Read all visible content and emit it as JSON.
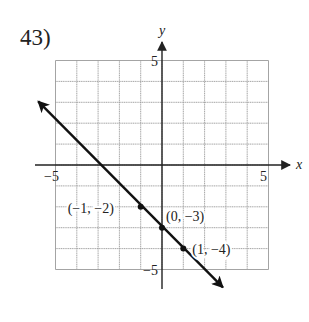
{
  "problem_number": "43)",
  "chart_data": {
    "type": "line",
    "title": "",
    "xlabel": "x",
    "ylabel": "y",
    "xlim": [
      -5,
      5
    ],
    "ylim": [
      -5,
      5
    ],
    "grid": true,
    "grid_step": 1,
    "x_tick_labels": [
      {
        "value": -5,
        "label": "−5"
      },
      {
        "value": 5,
        "label": "5"
      }
    ],
    "y_tick_labels": [
      {
        "value": 5,
        "label": "5"
      },
      {
        "value": -5,
        "label": "−5"
      }
    ],
    "line": {
      "equation": "y = -x - 3",
      "slope": -1,
      "intercept": -3,
      "arrow_start": [
        -6,
        3
      ],
      "arrow_end": [
        3,
        -6
      ]
    },
    "points": [
      {
        "x": -1,
        "y": -2,
        "label": "(−1, −2)"
      },
      {
        "x": 0,
        "y": -3,
        "label": "(0, −3)"
      },
      {
        "x": 1,
        "y": -4,
        "label": "(1, −4)"
      }
    ]
  },
  "colors": {
    "grid": "#9a9a9a",
    "axis": "#222222",
    "line": "#111111",
    "text": "#222222"
  }
}
